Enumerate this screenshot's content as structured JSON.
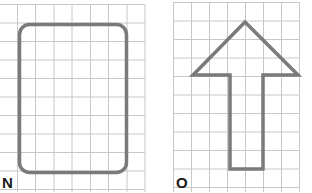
{
  "panels": [
    {
      "id": "N",
      "label": "N",
      "shape": "rounded-rectangle",
      "grid": {
        "cols": 8,
        "rows": 10,
        "cell_px": 18.2
      }
    },
    {
      "id": "O",
      "label": "O",
      "shape": "up-arrow",
      "grid": {
        "cols": 7,
        "rows": 10,
        "cell_px": 18.2
      }
    }
  ],
  "colors": {
    "grid_line": "#c8c8c8",
    "shape_stroke": "#7a7a7a",
    "label": "#1a1a1a",
    "background": "#ffffff"
  }
}
